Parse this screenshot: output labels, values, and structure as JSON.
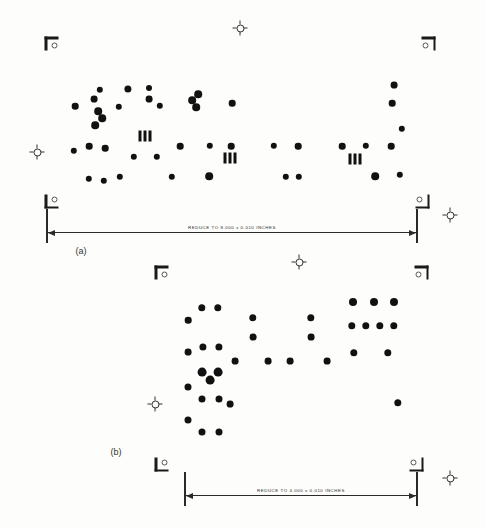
{
  "figure": {
    "background_color": "#fdfdfb",
    "ink_color": "#111111",
    "width": 485,
    "height": 529
  },
  "panels": [
    {
      "id": "panel-a",
      "caption": "(a)",
      "caption_pos": {
        "x": 81,
        "y": 251
      },
      "dimension": {
        "label": "REDUCE TO 8.000 ± 0.010 INCHES",
        "x": 46,
        "y": 209,
        "width": 372
      },
      "corners": [
        {
          "name": "corner-mark-top-left",
          "orient": "tl",
          "x": 53,
          "y": 45
        },
        {
          "name": "corner-mark-top-right",
          "orient": "tr",
          "x": 427,
          "y": 45
        },
        {
          "name": "corner-mark-bottom-left",
          "orient": "bl",
          "x": 53,
          "y": 200
        },
        {
          "name": "corner-mark-bottom-right",
          "orient": "br",
          "x": 421,
          "y": 200
        }
      ],
      "crosshairs": [
        {
          "name": "registration-target-top",
          "x": 240,
          "y": 28
        },
        {
          "name": "registration-target-left",
          "x": 37,
          "y": 152
        },
        {
          "name": "registration-target-right",
          "x": 450,
          "y": 215
        },
        {
          "name": "registration-target-bottom",
          "x": 299,
          "y": 262
        }
      ],
      "triple_bars": [
        {
          "x": 145,
          "y": 136
        },
        {
          "x": 230,
          "y": 158
        },
        {
          "x": 355,
          "y": 159
        }
      ],
      "dots": [
        {
          "x": 149,
          "y": 99,
          "r": 3.4
        },
        {
          "x": 149,
          "y": 88,
          "r": 3.0
        },
        {
          "x": 94,
          "y": 99,
          "r": 3.4
        },
        {
          "x": 100,
          "y": 90,
          "r": 3.2
        },
        {
          "x": 128,
          "y": 89,
          "r": 3.6
        },
        {
          "x": 75,
          "y": 106,
          "r": 3.3
        },
        {
          "x": 119,
          "y": 107,
          "r": 3.2
        },
        {
          "x": 160,
          "y": 106,
          "r": 3.2
        },
        {
          "x": 98,
          "y": 111,
          "r": 3.8
        },
        {
          "x": 102,
          "y": 118,
          "r": 3.8
        },
        {
          "x": 95,
          "y": 125,
          "r": 3.8
        },
        {
          "x": 192,
          "y": 100,
          "r": 3.8
        },
        {
          "x": 198,
          "y": 94,
          "r": 3.8
        },
        {
          "x": 196,
          "y": 107,
          "r": 3.8
        },
        {
          "x": 232,
          "y": 103,
          "r": 3.3
        },
        {
          "x": 394,
          "y": 85,
          "r": 3.4
        },
        {
          "x": 392,
          "y": 103,
          "r": 3.3
        },
        {
          "x": 402,
          "y": 129,
          "r": 3.2
        },
        {
          "x": 74,
          "y": 151,
          "r": 3.2
        },
        {
          "x": 89,
          "y": 146,
          "r": 3.3
        },
        {
          "x": 105,
          "y": 148,
          "r": 3.3
        },
        {
          "x": 134,
          "y": 157,
          "r": 3.2
        },
        {
          "x": 157,
          "y": 157,
          "r": 3.2
        },
        {
          "x": 180,
          "y": 146,
          "r": 3.3
        },
        {
          "x": 210,
          "y": 146,
          "r": 3.2
        },
        {
          "x": 231,
          "y": 146,
          "r": 3.3
        },
        {
          "x": 274,
          "y": 146,
          "r": 3.2
        },
        {
          "x": 298,
          "y": 146,
          "r": 3.3
        },
        {
          "x": 342,
          "y": 146,
          "r": 3.3
        },
        {
          "x": 366,
          "y": 146,
          "r": 3.2
        },
        {
          "x": 391,
          "y": 146,
          "r": 3.3
        },
        {
          "x": 89,
          "y": 179,
          "r": 3.2
        },
        {
          "x": 104,
          "y": 181,
          "r": 3.2
        },
        {
          "x": 120,
          "y": 177,
          "r": 3.2
        },
        {
          "x": 172,
          "y": 177,
          "r": 3.2
        },
        {
          "x": 209,
          "y": 176,
          "r": 3.8
        },
        {
          "x": 286,
          "y": 177,
          "r": 3.2
        },
        {
          "x": 299,
          "y": 177,
          "r": 3.2
        },
        {
          "x": 375,
          "y": 176,
          "r": 3.8
        },
        {
          "x": 400,
          "y": 175,
          "r": 3.2
        }
      ]
    },
    {
      "id": "panel-b",
      "caption": "(b)",
      "caption_pos": {
        "x": 116,
        "y": 452
      },
      "dimension": {
        "label": "REDUCE TO 4.000 ± 0.010 INCHES",
        "x": 184,
        "y": 472,
        "width": 234
      },
      "corners": [
        {
          "name": "corner-mark-top-left",
          "orient": "tl",
          "x": 163,
          "y": 274
        },
        {
          "name": "corner-mark-top-right",
          "orient": "tr",
          "x": 420,
          "y": 274
        },
        {
          "name": "corner-mark-bottom-left",
          "orient": "bl",
          "x": 163,
          "y": 463
        },
        {
          "name": "corner-mark-bottom-right",
          "orient": "br",
          "x": 415,
          "y": 463
        }
      ],
      "crosshairs": [
        {
          "name": "registration-target-left",
          "x": 155,
          "y": 404
        },
        {
          "name": "registration-target-right",
          "x": 450,
          "y": 478
        }
      ],
      "triple_bars": [],
      "dots": [
        {
          "x": 202,
          "y": 308,
          "r": 3.7
        },
        {
          "x": 218,
          "y": 308,
          "r": 3.7
        },
        {
          "x": 188,
          "y": 320,
          "r": 3.3
        },
        {
          "x": 253,
          "y": 318,
          "r": 3.7
        },
        {
          "x": 311,
          "y": 318,
          "r": 3.7
        },
        {
          "x": 253,
          "y": 337,
          "r": 3.4
        },
        {
          "x": 311,
          "y": 337,
          "r": 3.4
        },
        {
          "x": 353,
          "y": 302,
          "r": 4.0
        },
        {
          "x": 374,
          "y": 302,
          "r": 4.0
        },
        {
          "x": 394,
          "y": 302,
          "r": 4.0
        },
        {
          "x": 352,
          "y": 326,
          "r": 3.7
        },
        {
          "x": 366,
          "y": 326,
          "r": 3.7
        },
        {
          "x": 380,
          "y": 326,
          "r": 3.7
        },
        {
          "x": 394,
          "y": 326,
          "r": 3.7
        },
        {
          "x": 188,
          "y": 352,
          "r": 3.4
        },
        {
          "x": 203,
          "y": 347,
          "r": 3.6
        },
        {
          "x": 219,
          "y": 347,
          "r": 3.6
        },
        {
          "x": 235,
          "y": 361,
          "r": 3.4
        },
        {
          "x": 268,
          "y": 361,
          "r": 3.4
        },
        {
          "x": 290,
          "y": 361,
          "r": 3.4
        },
        {
          "x": 327,
          "y": 361,
          "r": 3.4
        },
        {
          "x": 354,
          "y": 353,
          "r": 3.7
        },
        {
          "x": 388,
          "y": 353,
          "r": 3.7
        },
        {
          "x": 202,
          "y": 372,
          "r": 4.4
        },
        {
          "x": 218,
          "y": 372,
          "r": 4.4
        },
        {
          "x": 210,
          "y": 380,
          "r": 4.4
        },
        {
          "x": 188,
          "y": 387,
          "r": 3.5
        },
        {
          "x": 202,
          "y": 399,
          "r": 3.5
        },
        {
          "x": 219,
          "y": 399,
          "r": 3.5
        },
        {
          "x": 230,
          "y": 404,
          "r": 3.4
        },
        {
          "x": 398,
          "y": 403,
          "r": 3.7
        },
        {
          "x": 188,
          "y": 420,
          "r": 3.5
        },
        {
          "x": 202,
          "y": 432,
          "r": 3.5
        },
        {
          "x": 219,
          "y": 432,
          "r": 3.5
        }
      ]
    }
  ]
}
